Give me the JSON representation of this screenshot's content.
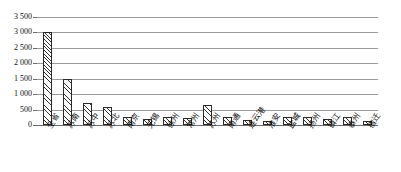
{
  "chart_data": {
    "type": "bar",
    "title": "",
    "subtitle": "",
    "xlabel": "",
    "ylabel": "",
    "ylim": [
      0,
      3500
    ],
    "ytick_step": 500,
    "ytick_labels": [
      "3 500",
      "3 000",
      "2 500",
      "2 000",
      "1 500",
      "1 000",
      "500",
      "0"
    ],
    "ytick_values": [
      3500,
      3000,
      2500,
      2000,
      1500,
      1000,
      500,
      0
    ],
    "grid": true,
    "legend": null,
    "legend_position": "none",
    "thousands_separator": " ",
    "bar_fill": "diagonal-hatch",
    "bar_edge_color": "#2a2a2a",
    "grid_color": "#9a9a9a",
    "categories": [
      "全省",
      "苏南",
      "苏中",
      "苏北",
      "南京",
      "无锡",
      "徐州",
      "常州",
      "苏州",
      "南通",
      "连云港",
      "淮安",
      "盐城",
      "扬州",
      "镇江",
      "泰州",
      "宿迁"
    ],
    "values": [
      3000,
      1500,
      700,
      600,
      250,
      200,
      250,
      220,
      650,
      250,
      150,
      130,
      250,
      250,
      180,
      250,
      130
    ]
  }
}
